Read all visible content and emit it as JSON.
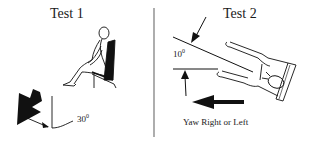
{
  "panels": [
    {
      "title": "Test 1",
      "subject": "seated-person",
      "angle_label": {
        "value": "30",
        "unit": "0"
      },
      "arrow_direction": "down-left"
    },
    {
      "title": "Test 2",
      "subject": "supine-person-on-board",
      "angle_label": {
        "value": "10",
        "unit": "0"
      },
      "arrow_direction": "left",
      "caption": "Yaw Right or Left"
    }
  ],
  "colors": {
    "ink": "#111111",
    "divider": "#777777",
    "background": "#ffffff"
  }
}
